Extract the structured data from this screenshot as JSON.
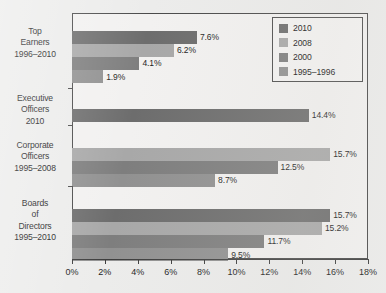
{
  "chart_data": {
    "type": "bar",
    "orientation": "horizontal",
    "title": "",
    "subtitle": "",
    "xlabel": "",
    "ylabel": "",
    "xlim": [
      0,
      18
    ],
    "xunit": "%",
    "grid": false,
    "legend_position": "top-right",
    "xticks": [
      "0%",
      "2%",
      "4%",
      "6%",
      "8%",
      "10%",
      "12%",
      "14%",
      "16%",
      "18%"
    ],
    "xtick_values": [
      0,
      2,
      4,
      6,
      8,
      10,
      12,
      14,
      16,
      18
    ],
    "categories": [
      {
        "lines": [
          "Top",
          "Earners",
          "1996–2010"
        ],
        "name": "Top Earners 1996-2010"
      },
      {
        "lines": [
          "Executive",
          "Officers",
          "2010"
        ],
        "name": "Executive Officers 2010"
      },
      {
        "lines": [
          "Corporate",
          "Officers",
          "1995–2008"
        ],
        "name": "Corporate Officers 1995-2008"
      },
      {
        "lines": [
          "Boards",
          "of",
          "Directors",
          "1995–2010"
        ],
        "name": "Boards of Directors 1995-2010"
      }
    ],
    "series": [
      {
        "name": "2010",
        "color": "#6d6d6d"
      },
      {
        "name": "2008",
        "color": "#a8a8a8"
      },
      {
        "name": "2000",
        "color": "#7e7e7e"
      },
      {
        "name": "1995–1996",
        "color": "#919191"
      }
    ],
    "groups": [
      {
        "category": "Top Earners 1996-2010",
        "bars": [
          {
            "series": "2010",
            "value": 7.6,
            "label": "7.6%",
            "color": "#6d6d6d"
          },
          {
            "series": "2008",
            "value": 6.2,
            "label": "6.2%",
            "color": "#a8a8a8"
          },
          {
            "series": "2000",
            "value": 4.1,
            "label": "4.1%",
            "color": "#7e7e7e"
          },
          {
            "series": "1995–1996",
            "value": 1.9,
            "label": "1.9%",
            "color": "#919191"
          }
        ]
      },
      {
        "category": "Executive Officers 2010",
        "bars": [
          {
            "series": "2010",
            "value": 14.4,
            "label": "14.4%",
            "color": "#6d6d6d"
          }
        ]
      },
      {
        "category": "Corporate Officers 1995-2008",
        "bars": [
          {
            "series": "2008",
            "value": 15.7,
            "label": "15.7%",
            "color": "#a8a8a8"
          },
          {
            "series": "2000",
            "value": 12.5,
            "label": "12.5%",
            "color": "#7e7e7e"
          },
          {
            "series": "1995–1996",
            "value": 8.7,
            "label": "8.7%",
            "color": "#919191"
          }
        ]
      },
      {
        "category": "Boards of Directors 1995-2010",
        "bars": [
          {
            "series": "2010",
            "value": 15.7,
            "label": "15.7%",
            "color": "#6d6d6d"
          },
          {
            "series": "2008",
            "value": 15.2,
            "label": "15.2%",
            "color": "#a8a8a8"
          },
          {
            "series": "2000",
            "value": 11.7,
            "label": "11.7%",
            "color": "#7e7e7e"
          },
          {
            "series": "1995–1996",
            "value": 9.5,
            "label": "9.5%",
            "color": "#919191"
          }
        ]
      }
    ]
  },
  "legend": {
    "items": [
      {
        "label": "2010",
        "color": "#6d6d6d"
      },
      {
        "label": "2008",
        "color": "#a8a8a8"
      },
      {
        "label": "2000",
        "color": "#7e7e7e"
      },
      {
        "label": "1995–1996",
        "color": "#919191"
      }
    ]
  },
  "watermark": {
    "text": ""
  }
}
